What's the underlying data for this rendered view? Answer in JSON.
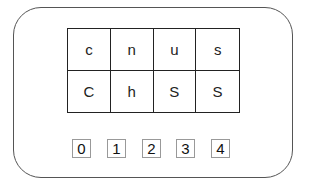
{
  "grid": {
    "rows": [
      [
        "c",
        "n",
        "u",
        "s"
      ],
      [
        "C",
        "h",
        "S",
        "S"
      ]
    ]
  },
  "indices": [
    "0",
    "1",
    "2",
    "3",
    "4"
  ]
}
